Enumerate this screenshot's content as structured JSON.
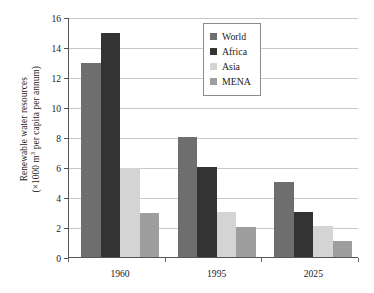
{
  "chart_data": {
    "type": "bar",
    "title": "",
    "subtitle": "",
    "xlabel": "",
    "ylabel_line1": "Renewable water resources",
    "ylabel_line2_pre": "(×1000 m",
    "ylabel_line2_sup": "3",
    "ylabel_line2_post": " per capita per annum)",
    "ylabel_plain": "Renewable water resources (×1000 m3 per capita per annum)",
    "categories": [
      "1960",
      "1995",
      "2025"
    ],
    "series": [
      {
        "name": "World",
        "color": "#6e6e6e",
        "values": [
          13.0,
          8.05,
          5.1
        ]
      },
      {
        "name": "Africa",
        "color": "#333333",
        "values": [
          15.0,
          6.05,
          3.1
        ]
      },
      {
        "name": "Asia",
        "color": "#d4d4d4",
        "values": [
          6.0,
          3.05,
          2.15
        ]
      },
      {
        "name": "MENA",
        "color": "#9e9e9e",
        "values": [
          3.0,
          2.1,
          1.15
        ]
      }
    ],
    "ylim": [
      0,
      16
    ],
    "ytick_step": 2,
    "yticks": [
      "0",
      "2",
      "4",
      "6",
      "8",
      "10",
      "12",
      "14",
      "16"
    ],
    "grid": true,
    "grid_color": "#c8c8c8",
    "axis_color": "#555555",
    "legend_position": "top-right",
    "legend_border_color": "#8a8a8a",
    "background": "#ffffff"
  }
}
